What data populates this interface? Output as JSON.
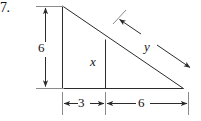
{
  "figure": {
    "problem_number": "7.",
    "background_color": "#ffffff",
    "stroke_color": "#2b2b2b",
    "labels": {
      "height": "6",
      "inner_segment": "x",
      "hypotenuse_offset": "y",
      "base_left": "3",
      "base_right": "6"
    },
    "geometry": {
      "apex": [
        62,
        6
      ],
      "bottom_left": [
        62,
        88
      ],
      "bottom_right": [
        183,
        88
      ],
      "inner_vertical_x": 105,
      "inner_vertical_top": [
        105,
        40
      ],
      "inner_vertical_bottom": [
        105,
        88
      ],
      "vertical_dim_x": 45,
      "vertical_dim_top": 6,
      "vertical_dim_bottom": 88,
      "base_dim_y": 103,
      "base_dim_left": 62,
      "base_dim_mid": 105,
      "base_dim_right": 188,
      "y_arrow_start": [
        118,
        18
      ],
      "y_arrow_end": [
        191,
        68
      ]
    }
  }
}
